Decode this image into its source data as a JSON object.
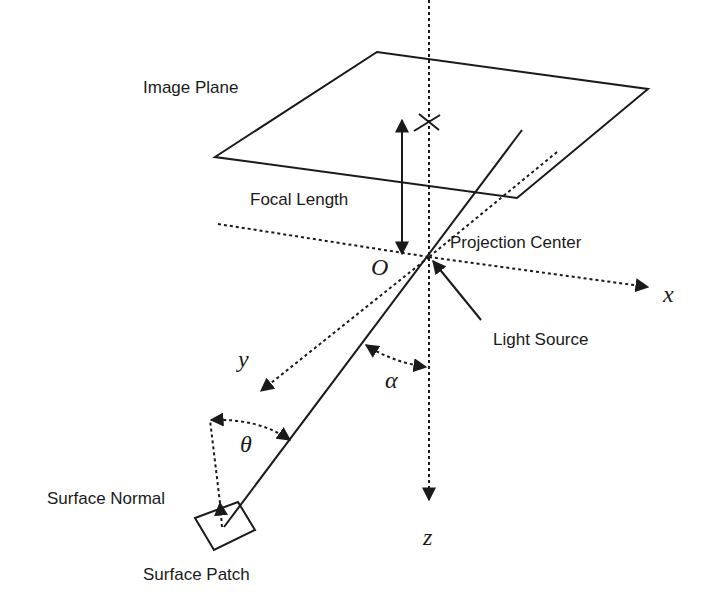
{
  "labels": {
    "image_plane": "Image Plane",
    "focal_length": "Focal Length",
    "projection_center": "Projection Center",
    "light_source": "Light Source",
    "surface_normal": "Surface Normal",
    "surface_patch": "Surface Patch"
  },
  "symbols": {
    "origin": "O",
    "x_axis": "x",
    "y_axis": "y",
    "z_axis": "z",
    "alpha": "α",
    "theta": "θ"
  },
  "colors": {
    "ink": "#1a1a1a",
    "background": "#ffffff"
  }
}
